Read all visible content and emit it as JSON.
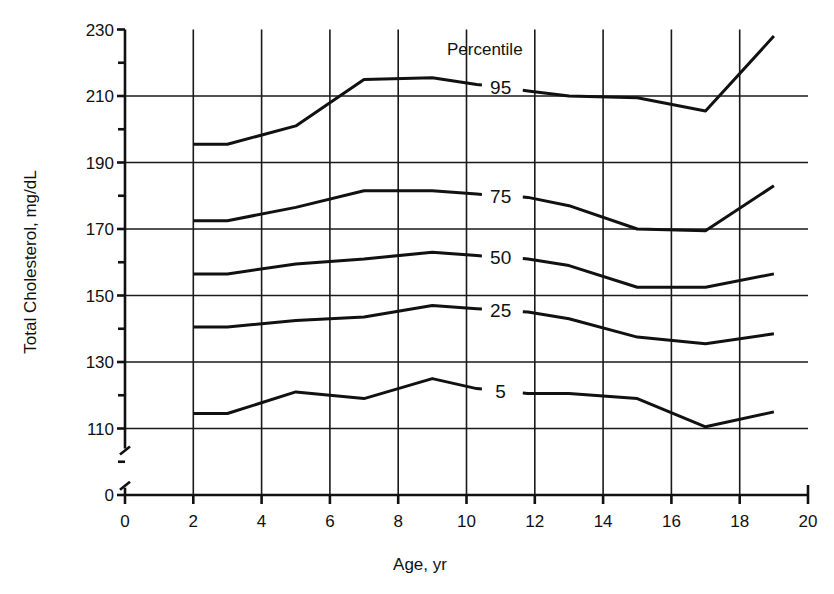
{
  "chart_data": {
    "type": "line",
    "title": "",
    "xlabel": "Age, yr",
    "ylabel": "Total Cholesterol, mg/dL",
    "legend_title": "Percentile",
    "xlim": [
      0,
      20
    ],
    "ylim": [
      0,
      230
    ],
    "y_axis_break": true,
    "y_axis_break_between": [
      0,
      110
    ],
    "grid": true,
    "x_ticks": [
      0,
      2,
      4,
      6,
      8,
      10,
      12,
      14,
      16,
      18,
      20
    ],
    "y_ticks": [
      0,
      110,
      130,
      150,
      170,
      190,
      210,
      230
    ],
    "y_minor_ticks": [
      100,
      120,
      140,
      160,
      180,
      200,
      220
    ],
    "series": [
      {
        "name": "95",
        "label_at": [
          11,
          214
        ],
        "x": [
          2,
          3,
          5,
          7,
          9,
          10.3,
          11.8,
          13,
          15,
          17,
          19
        ],
        "values": [
          195.5,
          195.5,
          201,
          215,
          215.5,
          213.5,
          211.5,
          210,
          209.5,
          205.5,
          228
        ]
      },
      {
        "name": "75",
        "label_at": [
          11,
          180
        ],
        "x": [
          2,
          3,
          5,
          7,
          9,
          10.3,
          11.8,
          13,
          15,
          17,
          19
        ],
        "values": [
          172.5,
          172.5,
          176.5,
          181.5,
          181.5,
          180.5,
          179.5,
          177,
          170,
          169.5,
          183
        ]
      },
      {
        "name": "50",
        "label_at": [
          11,
          162
        ],
        "x": [
          2,
          3,
          5,
          7,
          9,
          10.3,
          11.8,
          13,
          15,
          17,
          19
        ],
        "values": [
          156.5,
          156.5,
          159.5,
          161,
          163,
          162,
          161,
          159,
          152.5,
          152.5,
          156.5
        ]
      },
      {
        "name": "25",
        "label_at": [
          11,
          146
        ],
        "x": [
          2,
          3,
          5,
          7,
          9,
          10.3,
          11.8,
          13,
          15,
          17,
          19
        ],
        "values": [
          140.5,
          140.5,
          142.5,
          143.5,
          147,
          146,
          145,
          143,
          137.5,
          135.5,
          138.5
        ]
      },
      {
        "name": "5",
        "label_at": [
          11,
          121
        ],
        "x": [
          2,
          3,
          5,
          7,
          9,
          10.3,
          11.8,
          13,
          15,
          17,
          19
        ],
        "values": [
          114.5,
          114.5,
          121,
          119,
          125,
          122,
          120.5,
          120.5,
          119,
          110.5,
          115
        ]
      }
    ]
  },
  "colors": {
    "background": "#ffffff",
    "ink": "#111111"
  }
}
